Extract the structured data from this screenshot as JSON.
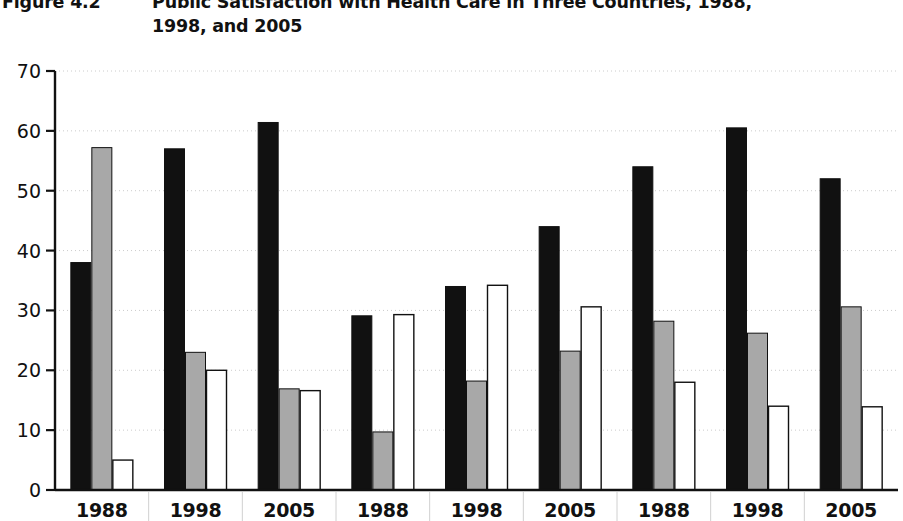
{
  "figure": {
    "number": "Figure 4.2",
    "title_line1": "Public Satisfaction with Health Care in Three Countries, 1988,",
    "title_line2": "1998, and 2005"
  },
  "chart_data": {
    "type": "bar",
    "title": "Public Satisfaction with Health Care in Three Countries, 1988, 1998, and 2005",
    "xlabel": "",
    "ylabel": "",
    "ylim": [
      0,
      70
    ],
    "yticks": [
      0,
      10,
      20,
      30,
      40,
      50,
      60,
      70
    ],
    "grid": true,
    "legend_position": "none",
    "categories": [
      "1988",
      "1998",
      "2005",
      "1988",
      "1998",
      "2005",
      "1988",
      "1998",
      "2005"
    ],
    "series": [
      {
        "name": "black-series",
        "color": "#111111",
        "values": [
          38.0,
          57.0,
          61.4,
          29.1,
          34.0,
          44.0,
          54.0,
          60.5,
          52.0
        ]
      },
      {
        "name": "gray-series",
        "color": "#a8a8a8",
        "values": [
          57.2,
          23.0,
          16.9,
          9.7,
          18.2,
          23.2,
          28.2,
          26.2,
          30.6
        ]
      },
      {
        "name": "white-series",
        "color": "#ffffff",
        "values": [
          5.0,
          20.0,
          16.6,
          29.3,
          34.2,
          30.6,
          18.0,
          14.0,
          13.9
        ]
      }
    ]
  },
  "axis": {
    "y_tick_labels": [
      "70",
      "60",
      "50",
      "40",
      "30",
      "20",
      "10",
      "0"
    ],
    "x_tick_labels": [
      "1988",
      "1998",
      "2005",
      "1988",
      "1998",
      "2005",
      "1988",
      "1998",
      "2005"
    ]
  },
  "colors": {
    "bar_black": "#111111",
    "bar_gray": "#a8a8a8",
    "bar_white": "#ffffff",
    "bar_outline": "#111111",
    "axis": "#111111",
    "gridline": "#cccccc"
  }
}
